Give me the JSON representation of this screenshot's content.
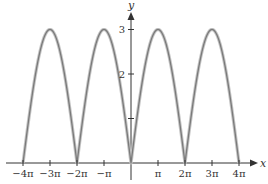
{
  "chart_data": {
    "type": "line",
    "title": "",
    "function": "y = 3|sin(x/2)|",
    "xlabel": "x",
    "ylabel": "y",
    "xlim_pi": [
      -4,
      4
    ],
    "ylim": [
      0,
      3
    ],
    "x_ticks": [
      {
        "value_pi": -4,
        "label": "−4π"
      },
      {
        "value_pi": -3,
        "label": "−3π"
      },
      {
        "value_pi": -2,
        "label": "−2π"
      },
      {
        "value_pi": -1,
        "label": "−π"
      },
      {
        "value_pi": 1,
        "label": "π"
      },
      {
        "value_pi": 2,
        "label": "2π"
      },
      {
        "value_pi": 3,
        "label": "3π"
      },
      {
        "value_pi": 4,
        "label": "4π"
      }
    ],
    "y_ticks": [
      {
        "value": 1,
        "label": ""
      },
      {
        "value": 2,
        "label": "2"
      },
      {
        "value": 3,
        "label": "3"
      }
    ],
    "key_points": [
      {
        "x_pi": -4,
        "y": 0
      },
      {
        "x_pi": -3,
        "y": 3
      },
      {
        "x_pi": -2,
        "y": 0
      },
      {
        "x_pi": -1,
        "y": 3
      },
      {
        "x_pi": 0,
        "y": 0
      },
      {
        "x_pi": 1,
        "y": 3
      },
      {
        "x_pi": 2,
        "y": 0
      },
      {
        "x_pi": 3,
        "y": 3
      },
      {
        "x_pi": 4,
        "y": 0
      }
    ],
    "amplitude": 3,
    "grid": false,
    "legend": "none",
    "colors": {
      "curve": "#7a7a7a",
      "curve_shadow": "#c4c4c4",
      "axis": "#333333"
    }
  }
}
